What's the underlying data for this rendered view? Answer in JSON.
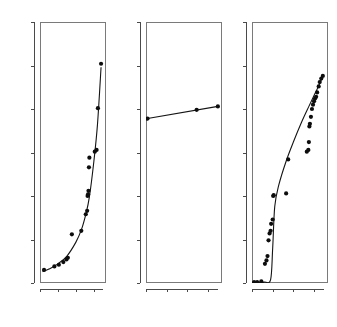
{
  "figure": {
    "panel_count": 3,
    "background_color": "#ffffff",
    "point_color": "#0d0d0d",
    "line_color": "#141414",
    "frame_color": "#7a7a7a"
  },
  "chart_data": [
    {
      "type": "scatter",
      "title": "j-curve",
      "xlabel": "Time",
      "ylabel": "Price",
      "xlim": [
        0,
        7
      ],
      "ylim": [
        0,
        300
      ],
      "xticks": [
        0,
        2,
        4,
        6
      ],
      "yticks": [
        0,
        50,
        100,
        150,
        200,
        250,
        300
      ],
      "grid": false,
      "legend": "none",
      "series": [
        {
          "name": "observed",
          "x": [
            0.45,
            1.6,
            2.1,
            2.6,
            2.95,
            3.1,
            3.55,
            4.6,
            5.1,
            5.25,
            5.3,
            5.35,
            5.4,
            5.45,
            5.5,
            6.1,
            6.3,
            6.45,
            6.8
          ],
          "y": [
            15,
            19,
            21,
            24,
            27,
            29,
            56,
            60,
            79,
            83,
            100,
            102,
            106,
            133,
            144,
            151,
            153,
            201,
            252
          ]
        },
        {
          "name": "fitted-exponential",
          "x": [
            0.3,
            1.0,
            2.0,
            3.0,
            4.0,
            4.6,
            5.1,
            5.5,
            6.0,
            6.4,
            6.8
          ],
          "y": [
            13,
            16,
            22,
            31,
            47,
            61,
            79,
            99,
            140,
            182,
            248
          ]
        }
      ]
    },
    {
      "type": "scatter",
      "title": "Straight curve",
      "xlabel": "Time",
      "ylabel": "Price",
      "xlim": [
        0,
        7
      ],
      "ylim": [
        0,
        300
      ],
      "xticks": [
        0,
        2,
        4,
        6
      ],
      "yticks": [
        0,
        50,
        100,
        150,
        200,
        250,
        300
      ],
      "grid": false,
      "legend": "none",
      "series": [
        {
          "name": "observed",
          "x": [
            0.15,
            4.9,
            6.95
          ],
          "y": [
            189,
            199,
            203
          ]
        },
        {
          "name": "fitted-linear",
          "x": [
            0.15,
            6.95
          ],
          "y": [
            189,
            203
          ]
        }
      ]
    },
    {
      "type": "scatter",
      "title": "s-curve",
      "xlabel": "Time",
      "ylabel": "Price",
      "xlim": [
        0,
        7
      ],
      "ylim": [
        0,
        300
      ],
      "xticks": [
        0,
        2,
        4,
        6
      ],
      "yticks": [
        0,
        50,
        100,
        150,
        200,
        250,
        300
      ],
      "grid": false,
      "legend": "none",
      "series": [
        {
          "name": "observed",
          "x": [
            0.2,
            0.5,
            0.9,
            1.25,
            1.4,
            1.5,
            1.6,
            1.7,
            1.8,
            1.85,
            2.0,
            2.05,
            2.1,
            3.3,
            3.5,
            5.3,
            5.45,
            5.5,
            5.55,
            5.6,
            5.7,
            5.8,
            5.9,
            6.0,
            6.1,
            6.2,
            6.3,
            6.45,
            6.55,
            6.7,
            6.85
          ],
          "y": [
            1,
            1,
            2,
            22,
            26,
            31,
            49,
            57,
            60,
            68,
            73,
            100,
            101,
            103,
            142,
            151,
            153,
            162,
            180,
            183,
            191,
            200,
            205,
            209,
            212,
            214,
            219,
            226,
            231,
            235,
            238
          ]
        },
        {
          "name": "fitted-logistic",
          "x": [
            0.2,
            1.2,
            1.8,
            2.0,
            2.2,
            2.6,
            3.3,
            4.0,
            4.8,
            5.5,
            6.1,
            6.5,
            6.85
          ],
          "y": [
            0,
            1,
            4,
            40,
            88,
            113,
            140,
            162,
            185,
            203,
            218,
            228,
            239
          ]
        }
      ]
    }
  ]
}
